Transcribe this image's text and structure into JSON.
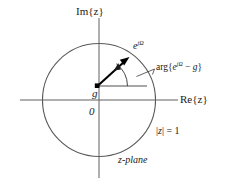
{
  "figure": {
    "caption": "z-plane unit circle diagram",
    "background_color": "#ffffff",
    "line_color": "#555555",
    "accent_color": "#000000"
  },
  "axes": {
    "imaginary_label": "Im{z}",
    "real_label": "Re{z}",
    "origin_label": "0",
    "origin_x": 99,
    "origin_y": 100,
    "h_axis_start_x": 20,
    "h_axis_end_x": 178,
    "v_axis_start_y": 18,
    "v_axis_end_y": 178
  },
  "unit_circle": {
    "center_x": 99,
    "center_y": 100,
    "radius": 57,
    "label": "|z| = 1",
    "magnitude_symbol": "z"
  },
  "points": {
    "g": {
      "label": "g",
      "x": 97,
      "y": 86
    },
    "ejomega": {
      "label_base": "e",
      "label_exponent": "jΩ",
      "x": 128,
      "y": 58
    }
  },
  "annotations": {
    "vector_label": "e",
    "vector_exponent": "jΩ",
    "angle_label_prefix": "arg{",
    "angle_label_base": "e",
    "angle_label_exponent": "jΩ",
    "angle_label_middle": " − ",
    "angle_label_var": "g",
    "angle_label_suffix": "}",
    "plane_label": "z-plane",
    "magnitude_label_prefix": "|",
    "magnitude_label_var": "z",
    "magnitude_label_suffix": "| = 1"
  }
}
